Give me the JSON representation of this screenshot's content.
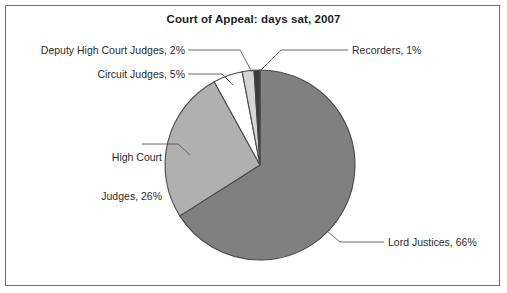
{
  "chart_data": {
    "type": "pie",
    "title": "Court of Appeal: days sat, 2007",
    "xlabel": "",
    "ylabel": "",
    "legend_position": "none",
    "grid": false,
    "categories": [
      "Lord Justices",
      "High Court Judges",
      "Circuit Judges",
      "Deputy High Court Judges",
      "Recorders"
    ],
    "values": [
      66,
      26,
      5,
      2,
      1
    ],
    "value_unit": "%",
    "start_angle_deg": 0,
    "direction": "clockwise",
    "slice_colors": [
      "#808080",
      "#b0b0b0",
      "#ffffff",
      "#d5d5d5",
      "#3a3a3a"
    ],
    "labels": [
      "Lord Justices, 66%",
      "High Court Judges, 26%",
      "Circuit Judges, 5%",
      "Deputy High Court Judges, 2%",
      "Recorders, 1%"
    ]
  },
  "title": "Court of Appeal: days sat, 2007",
  "slice_labels": {
    "deputy_high_court_judges": "Deputy High Court Judges, 2%",
    "circuit_judges": "Circuit Judges, 5%",
    "high_court_judges_line1": "High Court",
    "high_court_judges_line2": "Judges, 26%",
    "recorders": "Recorders, 1%",
    "lord_justices": "Lord Justices, 66%"
  },
  "colors": {
    "lord_justices": "#808080",
    "high_court_judges": "#b0b0b0",
    "circuit_judges": "#ffffff",
    "deputy_high_court_judges": "#d5d5d5",
    "recorders": "#3a3a3a",
    "slice_outline": "#4a4a4a",
    "leader_line": "#5a5a5a",
    "frame_border": "#6d6d6d",
    "text": "#2b2b2b",
    "background": "#ffffff"
  }
}
